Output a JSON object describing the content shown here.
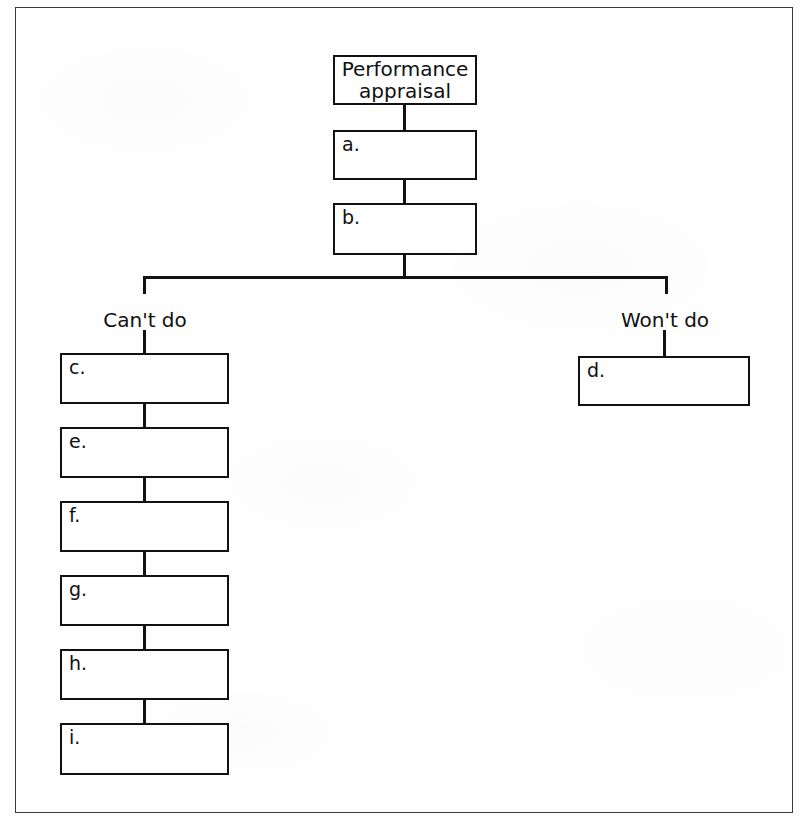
{
  "diagram": {
    "type": "flowchart",
    "orientation": "top-down",
    "root": {
      "id": "root",
      "title": "Performance\nappraisal",
      "x": 333,
      "y": 55,
      "w": 144,
      "h": 50
    },
    "stem_nodes": [
      {
        "id": "a",
        "label": "a.",
        "x": 333,
        "y": 130,
        "w": 144,
        "h": 50
      },
      {
        "id": "b",
        "label": "b.",
        "x": 333,
        "y": 203,
        "w": 144,
        "h": 52
      }
    ],
    "branches": [
      {
        "id": "cant-do",
        "label": "Can't do",
        "label_x": 145,
        "label_y": 308
      },
      {
        "id": "wont-do",
        "label": "Won't do",
        "label_x": 665,
        "label_y": 308
      }
    ],
    "cant_do_nodes": [
      {
        "id": "c",
        "label": "c.",
        "x": 60,
        "y": 353,
        "w": 169,
        "h": 51
      },
      {
        "id": "e",
        "label": "e.",
        "x": 60,
        "y": 427,
        "w": 169,
        "h": 51
      },
      {
        "id": "f",
        "label": "f.",
        "x": 60,
        "y": 501,
        "w": 169,
        "h": 51
      },
      {
        "id": "g",
        "label": "g.",
        "x": 60,
        "y": 575,
        "w": 169,
        "h": 51
      },
      {
        "id": "h",
        "label": "h.",
        "x": 60,
        "y": 649,
        "w": 169,
        "h": 51
      },
      {
        "id": "i",
        "label": "i.",
        "x": 60,
        "y": 723,
        "w": 169,
        "h": 52
      }
    ],
    "wont_do_nodes": [
      {
        "id": "d",
        "label": "d.",
        "x": 578,
        "y": 356,
        "w": 172,
        "h": 50
      }
    ],
    "connectors": {
      "root_to_a": {
        "x": 403,
        "y": 105,
        "w": 3,
        "h": 25
      },
      "a_to_b": {
        "x": 403,
        "y": 180,
        "w": 3,
        "h": 23
      },
      "b_to_split": {
        "x": 403,
        "y": 255,
        "w": 3,
        "h": 24
      },
      "horizontal_split": {
        "x": 143,
        "y": 276,
        "w": 524,
        "h": 3
      },
      "split_to_cant": {
        "x": 143,
        "y": 276,
        "w": 3,
        "h": 18
      },
      "cant_to_c": {
        "x": 143,
        "y": 330,
        "w": 3,
        "h": 24
      },
      "split_to_wont": {
        "x": 665,
        "y": 276,
        "w": 3,
        "h": 18
      },
      "wont_to_d": {
        "x": 663,
        "y": 330,
        "w": 3,
        "h": 27
      },
      "c_to_e": {
        "x": 143,
        "y": 403,
        "w": 3,
        "h": 25
      },
      "e_to_f": {
        "x": 143,
        "y": 477,
        "w": 3,
        "h": 25
      },
      "f_to_g": {
        "x": 143,
        "y": 551,
        "w": 3,
        "h": 25
      },
      "g_to_h": {
        "x": 143,
        "y": 625,
        "w": 3,
        "h": 25
      },
      "h_to_i": {
        "x": 143,
        "y": 699,
        "w": 3,
        "h": 25
      }
    },
    "colors": {
      "line": "#121212",
      "frame": "#3a3a3a",
      "background": "#fefefe",
      "node_fill": "#ffffff"
    }
  }
}
